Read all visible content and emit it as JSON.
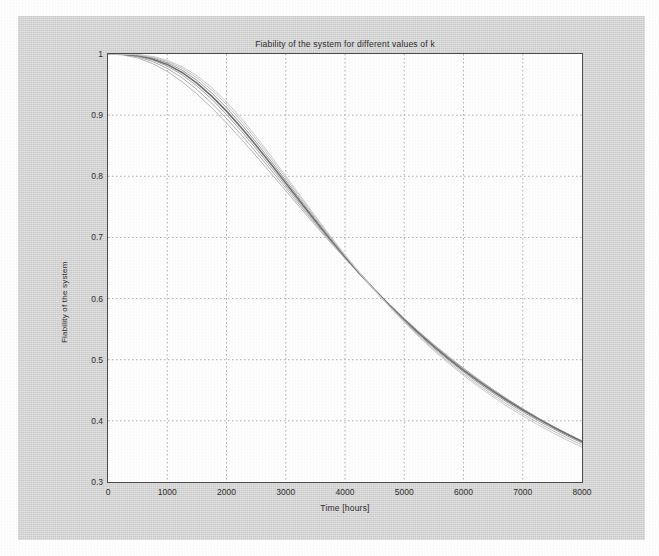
{
  "figure": {
    "background_color": "#d6d6d6",
    "plot_background_color": "#ffffff",
    "axis_color": "#4a4a4a",
    "grid_color": "#9a9a9a"
  },
  "chart_data": {
    "type": "line",
    "title": "Fiability of the system for different values of k",
    "xlabel": "Time [hours]",
    "ylabel": "Fiability of the system",
    "xlim": [
      0,
      8000
    ],
    "ylim": [
      0.3,
      1
    ],
    "xticks": [
      0,
      1000,
      2000,
      3000,
      4000,
      5000,
      6000,
      7000,
      8000
    ],
    "xticklabels": [
      "0",
      "1000",
      "2000",
      "3000",
      "4000",
      "5000",
      "6000",
      "7000",
      "8000"
    ],
    "yticks": [
      0.3,
      0.4,
      0.5,
      0.6,
      0.7,
      0.8,
      0.9,
      1
    ],
    "yticklabels": [
      "0.3",
      "0.4",
      "0.5",
      "0.6",
      "0.7",
      "0.8",
      "0.9",
      "1"
    ],
    "grid": true,
    "grid_style": "dotted",
    "legend": null,
    "x": [
      0,
      250,
      500,
      750,
      1000,
      1250,
      1500,
      1750,
      2000,
      2250,
      2500,
      2750,
      3000,
      3250,
      3500,
      3750,
      4000,
      4250,
      4500,
      4750,
      5000,
      5250,
      5500,
      5750,
      6000,
      6250,
      6500,
      6750,
      7000,
      7250,
      7500,
      7750,
      8000
    ],
    "series": [
      {
        "name": "k = 1",
        "color": "#b8b8b8",
        "width": 1.0,
        "values": [
          1.0,
          0.9985,
          0.9935,
          0.9845,
          0.9715,
          0.9548,
          0.9348,
          0.9121,
          0.8872,
          0.8607,
          0.8331,
          0.8048,
          0.7763,
          0.7478,
          0.7197,
          0.6922,
          0.6654,
          0.6395,
          0.6146,
          0.5906,
          0.5677,
          0.5458,
          0.5249,
          0.5051,
          0.4862,
          0.4682,
          0.4512,
          0.435,
          0.4196,
          0.405,
          0.3912,
          0.378,
          0.3655
        ]
      },
      {
        "name": "k = 2",
        "color": "#b0b0b0",
        "width": 1.0,
        "values": [
          1.0,
          0.999,
          0.9952,
          0.9878,
          0.9765,
          0.9611,
          0.9419,
          0.9196,
          0.8946,
          0.8677,
          0.8394,
          0.8103,
          0.7808,
          0.7514,
          0.7224,
          0.694,
          0.6665,
          0.64,
          0.6146,
          0.5903,
          0.5672,
          0.5452,
          0.5243,
          0.5045,
          0.4857,
          0.4679,
          0.451,
          0.435,
          0.4197,
          0.4053,
          0.3915,
          0.3784,
          0.366
        ]
      },
      {
        "name": "k = 3",
        "color": "#a6a6a6",
        "width": 1.0,
        "values": [
          1.0,
          0.9994,
          0.9965,
          0.9902,
          0.9802,
          0.966,
          0.9478,
          0.926,
          0.9011,
          0.8739,
          0.8451,
          0.8152,
          0.7848,
          0.7545,
          0.7246,
          0.6954,
          0.6671,
          0.6399,
          0.614,
          0.5893,
          0.5659,
          0.5437,
          0.5228,
          0.503,
          0.4843,
          0.4667,
          0.45,
          0.4343,
          0.4194,
          0.4053,
          0.3919,
          0.3793,
          0.3673
        ]
      },
      {
        "name": "k = 4",
        "color": "#6f6f6f",
        "width": 1.6,
        "values": [
          1.0,
          0.9996,
          0.9974,
          0.992,
          0.983,
          0.9698,
          0.9524,
          0.9312,
          0.9066,
          0.8794,
          0.8503,
          0.82,
          0.789,
          0.758,
          0.7274,
          0.6975,
          0.6686,
          0.6408,
          0.6143,
          0.5891,
          0.5653,
          0.5427,
          0.5215,
          0.5015,
          0.4827,
          0.465,
          0.4483,
          0.4325,
          0.4177,
          0.4037,
          0.3905,
          0.378,
          0.3662
        ]
      },
      {
        "name": "k = 5",
        "color": "#9c9c9c",
        "width": 1.0,
        "values": [
          1.0,
          0.9998,
          0.9982,
          0.9937,
          0.9857,
          0.9735,
          0.957,
          0.9364,
          0.9122,
          0.885,
          0.8556,
          0.8248,
          0.7932,
          0.7614,
          0.73,
          0.6993,
          0.6696,
          0.6411,
          0.6139,
          0.5882,
          0.5638,
          0.5409,
          0.5193,
          0.499,
          0.48,
          0.4621,
          0.4454,
          0.4296,
          0.4148,
          0.4009,
          0.3878,
          0.3754,
          0.3638
        ]
      },
      {
        "name": "k = 6",
        "color": "#c2c2c2",
        "width": 1.0,
        "values": [
          1.0,
          0.9999,
          0.9988,
          0.9951,
          0.9879,
          0.9767,
          0.9611,
          0.9411,
          0.9173,
          0.8902,
          0.8606,
          0.8293,
          0.7971,
          0.7647,
          0.7325,
          0.7011,
          0.6707,
          0.6415,
          0.6137,
          0.5873,
          0.5624,
          0.539,
          0.517,
          0.4964,
          0.4771,
          0.459,
          0.4421,
          0.4262,
          0.4114,
          0.3974,
          0.3843,
          0.372,
          0.3604
        ]
      },
      {
        "name": "k = 7",
        "color": "#cbcbcb",
        "width": 1.0,
        "values": [
          1.0,
          0.9999,
          0.9992,
          0.9961,
          0.9897,
          0.9793,
          0.9645,
          0.9452,
          0.9218,
          0.8948,
          0.865,
          0.8333,
          0.8006,
          0.7676,
          0.7348,
          0.7027,
          0.6717,
          0.6419,
          0.6135,
          0.5866,
          0.5612,
          0.5373,
          0.5149,
          0.494,
          0.4744,
          0.4561,
          0.439,
          0.4229,
          0.408,
          0.3939,
          0.3808,
          0.3685,
          0.3569
        ]
      }
    ]
  }
}
